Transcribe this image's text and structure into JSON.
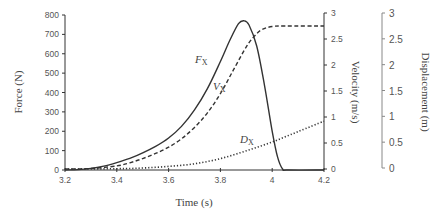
{
  "chart_data": {
    "type": "line",
    "title": "",
    "xlabel": "Time (s)",
    "ylabel": "Force (N)",
    "y2label": "Velocity (m/s)",
    "y3label": "Displacement (m)",
    "xlim": [
      3.2,
      4.2
    ],
    "ylim": [
      0,
      800
    ],
    "y2lim": [
      0,
      3
    ],
    "y3lim": [
      0,
      3
    ],
    "x_ticks": [
      "3.2",
      "3.4",
      "3.6",
      "3.8",
      "4",
      "4.2"
    ],
    "y_ticks": [
      "0",
      "100",
      "200",
      "300",
      "400",
      "500",
      "600",
      "700",
      "800"
    ],
    "y2_ticks": [
      "0",
      "0.5",
      "1",
      "1.5",
      "2",
      "2.5",
      "3"
    ],
    "y3_ticks": [
      "0",
      "0.5",
      "1",
      "1.5",
      "2",
      "2.5",
      "3"
    ],
    "grid": false,
    "legend": "inline labels",
    "series": [
      {
        "name": "Fx",
        "label_main": "F",
        "label_sub": "X",
        "axis": "force",
        "style": "solid",
        "x": [
          3.2,
          3.25,
          3.3,
          3.35,
          3.4,
          3.45,
          3.5,
          3.55,
          3.6,
          3.65,
          3.7,
          3.75,
          3.8,
          3.84,
          3.87,
          3.89,
          3.91,
          3.94,
          3.97,
          4.0,
          4.02,
          4.04,
          4.06,
          4.2
        ],
        "values": [
          0,
          2,
          8,
          20,
          38,
          60,
          88,
          122,
          165,
          225,
          310,
          420,
          560,
          680,
          755,
          770,
          750,
          640,
          440,
          200,
          70,
          5,
          0,
          0
        ]
      },
      {
        "name": "Vx",
        "label_main": "V",
        "label_sub": "X",
        "axis": "velocity",
        "style": "dashed",
        "x": [
          3.2,
          3.3,
          3.4,
          3.45,
          3.5,
          3.55,
          3.6,
          3.65,
          3.7,
          3.75,
          3.8,
          3.85,
          3.9,
          3.93,
          3.96,
          4.0,
          4.05,
          4.2
        ],
        "values": [
          0,
          0.01,
          0.06,
          0.12,
          0.2,
          0.3,
          0.42,
          0.58,
          0.8,
          1.08,
          1.45,
          1.9,
          2.35,
          2.55,
          2.68,
          2.74,
          2.75,
          2.75
        ]
      },
      {
        "name": "Dx",
        "label_main": "D",
        "label_sub": "X",
        "axis": "displacement",
        "style": "dotted",
        "x": [
          3.2,
          3.4,
          3.5,
          3.6,
          3.7,
          3.8,
          3.9,
          4.0,
          4.1,
          4.2
        ],
        "values": [
          0,
          0.005,
          0.02,
          0.05,
          0.1,
          0.2,
          0.35,
          0.52,
          0.72,
          0.92
        ]
      }
    ]
  }
}
